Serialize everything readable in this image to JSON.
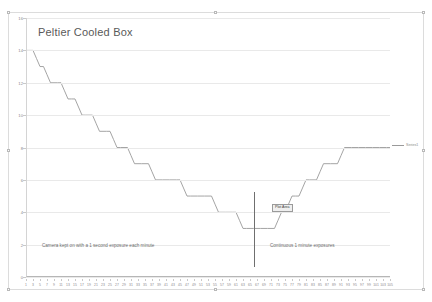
{
  "chart": {
    "title": "Peltier Cooled Box",
    "plot_area_label": "Plot Area",
    "legend": {
      "label": "Series1",
      "swatch_name": "series1-line-swatch"
    },
    "annotations": {
      "left": "Camera kept on with a 1 second exposure each minute",
      "right": "Continuous 1 minute exposures",
      "divider_name": "phase-divider-line"
    }
  },
  "chart_data": {
    "type": "line",
    "title": "Peltier Cooled Box",
    "xlabel": "",
    "ylabel": "",
    "ylim": [
      0,
      16
    ],
    "xlim": [
      1,
      105
    ],
    "grid": true,
    "legend_position": "right",
    "y_ticks": [
      0,
      2,
      4,
      6,
      8,
      10,
      12,
      14,
      16
    ],
    "x_ticks": [
      1,
      3,
      5,
      7,
      9,
      11,
      13,
      15,
      17,
      19,
      21,
      23,
      25,
      27,
      29,
      31,
      33,
      35,
      37,
      39,
      41,
      43,
      45,
      47,
      49,
      51,
      53,
      55,
      57,
      59,
      61,
      63,
      65,
      67,
      69,
      71,
      73,
      75,
      77,
      79,
      81,
      83,
      85,
      87,
      89,
      91,
      93,
      95,
      97,
      99,
      101,
      103,
      105
    ],
    "series": [
      {
        "name": "Series1",
        "x": [
          1,
          2,
          3,
          4,
          5,
          6,
          7,
          8,
          9,
          10,
          11,
          12,
          13,
          14,
          15,
          16,
          17,
          18,
          19,
          20,
          21,
          22,
          23,
          24,
          25,
          26,
          27,
          28,
          29,
          30,
          31,
          32,
          33,
          34,
          35,
          36,
          37,
          38,
          39,
          40,
          41,
          42,
          43,
          44,
          45,
          46,
          47,
          48,
          49,
          50,
          51,
          52,
          53,
          54,
          55,
          56,
          57,
          58,
          59,
          60,
          61,
          62,
          63,
          64,
          65,
          66,
          67,
          68,
          69,
          70,
          71,
          72,
          73,
          74,
          75,
          76,
          77,
          78,
          79,
          80,
          81,
          82,
          83,
          84,
          85,
          86,
          87,
          88,
          89,
          90,
          91,
          92,
          93,
          94,
          95,
          96,
          97,
          98,
          99,
          100,
          101,
          102,
          103,
          104,
          105
        ],
        "y": [
          14,
          14,
          14,
          13.5,
          13,
          13,
          12.5,
          12,
          12,
          12,
          12,
          11.5,
          11,
          11,
          11,
          10.5,
          10,
          10,
          10,
          10,
          9.5,
          9,
          9,
          9,
          9,
          8.5,
          8,
          8,
          8,
          8,
          7.5,
          7,
          7,
          7,
          7,
          7,
          6.5,
          6,
          6,
          6,
          6,
          6,
          6,
          6,
          6,
          5.5,
          5,
          5,
          5,
          5,
          5,
          5,
          5,
          5,
          4.5,
          4,
          4,
          4,
          4,
          4,
          4,
          3.5,
          3,
          3,
          3,
          3,
          3,
          3,
          3,
          3,
          3,
          3,
          3.5,
          4,
          4,
          4.5,
          5,
          5,
          5,
          5.5,
          6,
          6,
          6,
          6,
          6.5,
          7,
          7,
          7,
          7,
          7,
          7.5,
          8,
          8,
          8,
          8,
          8,
          8,
          8,
          8,
          8,
          8,
          8,
          8,
          8,
          8
        ]
      }
    ],
    "annotations": [
      {
        "text": "Camera kept on with a 1 second exposure each minute",
        "x_range": [
          1,
          60
        ],
        "y": 2.3
      },
      {
        "text": "Continuous 1 minute exposures",
        "x_range": [
          64,
          105
        ],
        "y": 2.3
      },
      {
        "text": "Plot Area",
        "x": 72,
        "y": 4.4
      }
    ],
    "vertical_marker": {
      "x": 63,
      "y_range": [
        0.6,
        5.1
      ]
    }
  }
}
